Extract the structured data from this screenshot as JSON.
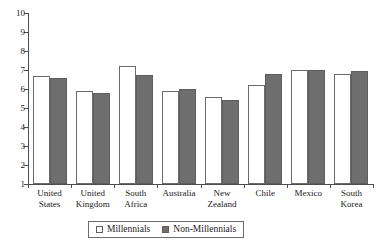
{
  "chart_data": {
    "type": "bar",
    "title": "",
    "subtitle": "",
    "xlabel": "",
    "ylabel": "",
    "ylim": [
      1,
      10
    ],
    "ytick_values": [
      10,
      9,
      8,
      7,
      6,
      5,
      4,
      3,
      2,
      1
    ],
    "ytick_labels": [
      "10",
      "9",
      "8",
      "7",
      "6",
      "5",
      "4",
      "3",
      "2",
      "1"
    ],
    "grid": false,
    "legend_position": "bottom",
    "categories": [
      "United States",
      "United Kingdom",
      "South Africa",
      "Australia",
      "New Zealand",
      "Chile",
      "Mexico",
      "South Korea"
    ],
    "category_lines": [
      [
        "United",
        "States"
      ],
      [
        "United",
        "Kingdom"
      ],
      [
        "South",
        "Africa"
      ],
      [
        "Australia",
        ""
      ],
      [
        "New",
        "Zealand"
      ],
      [
        "Chile",
        ""
      ],
      [
        "Mexico",
        ""
      ],
      [
        "South",
        "Korea"
      ]
    ],
    "series": [
      {
        "name": "Millennials",
        "color": "#ffffff",
        "values": [
          6.7,
          5.9,
          7.2,
          5.9,
          5.6,
          6.2,
          7.0,
          6.8
        ]
      },
      {
        "name": "Non-Millennials",
        "color": "#6e6e6e",
        "values": [
          6.6,
          5.8,
          6.75,
          6.0,
          5.4,
          6.8,
          7.0,
          6.95
        ]
      }
    ]
  },
  "legend": {
    "items": [
      {
        "label": "Millennials",
        "swatch": "white-square-icon"
      },
      {
        "label": "Non-Millennials",
        "swatch": "gray-square-icon"
      }
    ]
  }
}
